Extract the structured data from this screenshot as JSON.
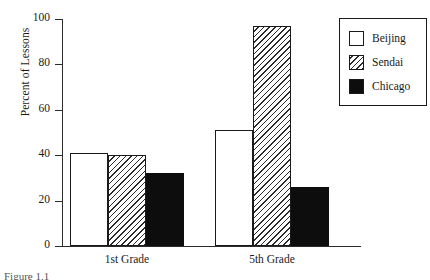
{
  "chart_data": {
    "type": "bar",
    "title": "",
    "xlabel": "",
    "ylabel": "Percent of Lessons",
    "categories": [
      "1st Grade",
      "5th Grade"
    ],
    "series": [
      {
        "name": "Beijing",
        "values": [
          41,
          51
        ],
        "fill": "solid-white"
      },
      {
        "name": "Sendai",
        "values": [
          40,
          97
        ],
        "fill": "diagonal-hatch"
      },
      {
        "name": "Chicago",
        "values": [
          32,
          26
        ],
        "fill": "solid-black"
      }
    ],
    "ylim": [
      0,
      100
    ],
    "yticks": [
      0,
      20,
      40,
      60,
      80,
      100
    ],
    "ytick_labels": [
      "0",
      "20",
      "40",
      "60",
      "80",
      "100"
    ],
    "grid": false,
    "legend_position": "top-right",
    "colors": {
      "outline": "#1a1a1a",
      "beijing": "#ffffff",
      "sendai": "#ffffff",
      "chicago": "#0d0d0d",
      "axis": "#2b2b2b"
    }
  },
  "caption": {
    "text": "Figure 1.1"
  }
}
